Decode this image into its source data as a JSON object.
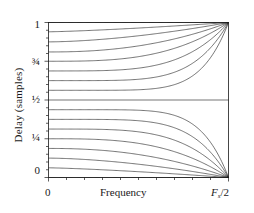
{
  "chart_data": {
    "type": "line",
    "title": "",
    "xlabel": "Frequency",
    "ylabel": "Delay (samples)",
    "xlim": [
      0,
      1
    ],
    "ylim": [
      0,
      1
    ],
    "grid": false,
    "legend": "none",
    "x_tick_labels": [
      "0",
      "Fs/2"
    ],
    "x_tick_values": [
      0,
      1
    ],
    "y_tick_labels": [
      "0",
      "1/4",
      "1/2",
      "3/4",
      "1"
    ],
    "y_tick_values": [
      0,
      0.25,
      0.5,
      0.75,
      1.0
    ],
    "y_minor_ticks": [
      0.05,
      0.1,
      0.15,
      0.2,
      0.3,
      0.35,
      0.4,
      0.45,
      0.55,
      0.6,
      0.65,
      0.7,
      0.8,
      0.85,
      0.9,
      0.95
    ],
    "x_minor_ticks": [
      0.1,
      0.2,
      0.3,
      0.4,
      0.5,
      0.6,
      0.7,
      0.8,
      0.9
    ],
    "line_color": "#1a1a1a",
    "line_width": 0.6,
    "series": [
      {
        "name": "d = 1.00",
        "d0": 1.0,
        "endpoint": 1.0
      },
      {
        "name": "d = 0.94",
        "d0": 0.94,
        "endpoint": 1.0
      },
      {
        "name": "d = 0.875",
        "d0": 0.875,
        "endpoint": 1.0
      },
      {
        "name": "d = 0.81",
        "d0": 0.81,
        "endpoint": 1.0
      },
      {
        "name": "d = 0.75",
        "d0": 0.75,
        "endpoint": 1.0
      },
      {
        "name": "d = 0.6875",
        "d0": 0.6875,
        "endpoint": 1.0
      },
      {
        "name": "d = 0.625",
        "d0": 0.625,
        "endpoint": 1.0
      },
      {
        "name": "d = 0.5625",
        "d0": 0.5625,
        "endpoint": 1.0
      },
      {
        "name": "d = 0.50",
        "d0": 0.5,
        "endpoint": 0.5
      },
      {
        "name": "d = 0.4375",
        "d0": 0.4375,
        "endpoint": 0.0
      },
      {
        "name": "d = 0.375",
        "d0": 0.375,
        "endpoint": 0.0
      },
      {
        "name": "d = 0.3125",
        "d0": 0.3125,
        "endpoint": 0.0
      },
      {
        "name": "d = 0.25",
        "d0": 0.25,
        "endpoint": 0.0
      },
      {
        "name": "d = 0.1875",
        "d0": 0.1875,
        "endpoint": 0.0
      },
      {
        "name": "d = 0.125",
        "d0": 0.125,
        "endpoint": 0.0
      },
      {
        "name": "d = 0.0625",
        "d0": 0.0625,
        "endpoint": 0.0
      },
      {
        "name": "d = 0.00",
        "d0": 0.0,
        "endpoint": 0.0
      }
    ]
  },
  "axes": {
    "y_label": "Delay (samples)",
    "x_label": "Frequency",
    "y_ticks": [
      {
        "value": 1.0,
        "label": "1"
      },
      {
        "value": 0.75,
        "label": "3/4",
        "num": "3",
        "den": "4"
      },
      {
        "value": 0.5,
        "label": "1/2",
        "num": "1",
        "den": "2"
      },
      {
        "value": 0.25,
        "label": "1/4",
        "num": "1",
        "den": "4"
      },
      {
        "value": 0.0,
        "label": "0"
      }
    ],
    "x_ticks": [
      {
        "value": 0.0,
        "label": "0"
      },
      {
        "value": 1.0,
        "label": "Fs/2",
        "main": "F",
        "subscript": "s",
        "tail": "/2"
      }
    ]
  }
}
